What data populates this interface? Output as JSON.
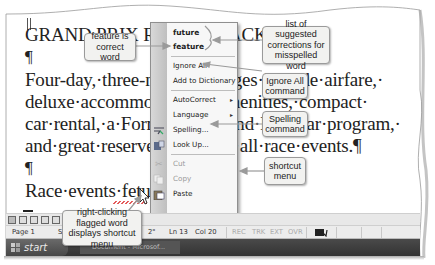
{
  "document": {
    "lines": [
      "GRAND PRIX RACING PACKAGE",
      "¶",
      "Four-day,·three-night·packages·include·airfare,·",
      "deluxe·accommodations,·amenities,·compact·",
      "car·rental,·a·Formula·One·and·IndyCar·program,·",
      "and·great·reserved·seats·for·all·race·events.¶",
      "¶",
      "Race·events·fetuke"
    ],
    "misspelled_word": "fetuke"
  },
  "context_menu": {
    "suggestions": [
      "future",
      "feature"
    ],
    "items": [
      {
        "label": "Ignore All",
        "icon": "",
        "enabled": true,
        "submenu": false
      },
      {
        "label": "Add to Dictionary",
        "icon": "",
        "enabled": true,
        "submenu": false
      },
      {
        "label": "AutoCorrect",
        "icon": "",
        "enabled": true,
        "submenu": true
      },
      {
        "label": "Language",
        "icon": "",
        "enabled": true,
        "submenu": true
      },
      {
        "label": "Spelling...",
        "icon": "spelling-icon",
        "enabled": true,
        "submenu": false
      },
      {
        "label": "Look Up...",
        "icon": "research-book-icon",
        "enabled": true,
        "submenu": false
      },
      {
        "label": "Cut",
        "icon": "scissors-icon",
        "enabled": false,
        "submenu": false
      },
      {
        "label": "Copy",
        "icon": "copy-icon",
        "enabled": false,
        "submenu": false
      },
      {
        "label": "Paste",
        "icon": "clipboard-icon",
        "enabled": true,
        "submenu": false
      }
    ],
    "submenu_glyph": "▸"
  },
  "callouts": {
    "feature_correct": "feature is correct word",
    "suggested_list": "list of suggested corrections for misspelled word",
    "ignore_all": "Ignore All command",
    "spelling": "Spelling command",
    "shortcut_menu": "shortcut menu",
    "right_click": "right-clicking flagged word displays shortcut menu"
  },
  "status_bar": {
    "page": "Page 1",
    "section": "Se",
    "at": "2\"",
    "line": "Ln 13",
    "col": "Col 20",
    "rec": "REC",
    "trk": "TRK",
    "ext": "EXT",
    "ovr": "OVR"
  },
  "taskbar": {
    "start_label": "start",
    "task_label": "Document - Microsof..."
  },
  "colors": {
    "menu_bg": "#f7f7f7",
    "callout_bg": "#f2f2f0",
    "arrow": "#9a9a9a",
    "taskbar": "#3c3c3c"
  }
}
